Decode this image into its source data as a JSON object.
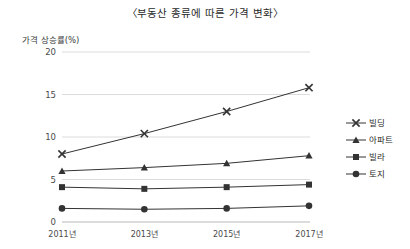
{
  "chart_data": {
    "type": "line",
    "title": "〈부동산 종류에 따른 가격 변화〉",
    "ylabel": "가격 상승률(%)",
    "xlabel": "",
    "categories": [
      "2011년",
      "2013년",
      "2015년",
      "2017년"
    ],
    "yticks": [
      "0",
      "5",
      "10",
      "15",
      "20"
    ],
    "ylim": [
      0,
      20
    ],
    "grid": true,
    "legend_position": "right",
    "series": [
      {
        "name": "빌딩",
        "marker": "x",
        "values": [
          8.0,
          10.4,
          13.0,
          15.8
        ]
      },
      {
        "name": "아파트",
        "marker": "triangle",
        "values": [
          6.0,
          6.4,
          6.9,
          7.8
        ]
      },
      {
        "name": "빌라",
        "marker": "square",
        "values": [
          4.1,
          3.9,
          4.1,
          4.4
        ]
      },
      {
        "name": "토지",
        "marker": "circle",
        "values": [
          1.6,
          1.5,
          1.6,
          1.9
        ]
      }
    ]
  },
  "colors": {
    "line": "#333333",
    "grid": "#dcdcdc",
    "text": "#333333"
  }
}
